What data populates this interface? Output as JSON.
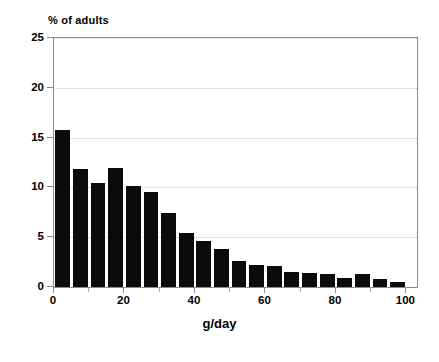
{
  "chart_data": {
    "type": "bar",
    "title": "",
    "subtitle": "",
    "xlabel": "g/day",
    "ylabel": "% of adults",
    "xlim": [
      0,
      103
    ],
    "ylim": [
      0,
      25
    ],
    "grid": true,
    "legend": null,
    "bar_width_units": 4.2,
    "x_tick_labels": [
      "0",
      "20",
      "40",
      "60",
      "80",
      "100"
    ],
    "x_tick_values": [
      0,
      20,
      40,
      60,
      80,
      100
    ],
    "x_minor_tick_values": [
      10,
      30,
      50,
      70,
      90
    ],
    "y_tick_labels": [
      "0",
      "5",
      "10",
      "15",
      "20",
      "25"
    ],
    "y_tick_values": [
      0,
      5,
      10,
      15,
      20,
      25
    ],
    "gridline_values": [
      5,
      10,
      15,
      20,
      25
    ],
    "x": [
      2.5,
      7.5,
      12.5,
      17.5,
      22.5,
      27.5,
      32.5,
      37.5,
      42.5,
      47.5,
      52.5,
      57.5,
      62.5,
      67.5,
      72.5,
      77.5,
      82.5,
      87.5,
      92.5,
      97.5
    ],
    "categories": [
      "0-5",
      "5-10",
      "10-15",
      "15-20",
      "20-25",
      "25-30",
      "30-35",
      "35-40",
      "40-45",
      "45-50",
      "50-55",
      "55-60",
      "60-65",
      "65-70",
      "70-75",
      "75-80",
      "80-85",
      "85-90",
      "90-95",
      "95-100"
    ],
    "values": [
      15.8,
      11.8,
      10.4,
      11.9,
      10.1,
      9.5,
      7.4,
      5.4,
      4.6,
      3.8,
      2.6,
      2.2,
      2.1,
      1.5,
      1.4,
      1.3,
      0.9,
      1.3,
      0.85,
      0.5
    ],
    "bar_color": "#0b0b0b",
    "axis_color": "#8a8a8a",
    "grid_color": "#c9c9c9",
    "background_color": "#ffffff"
  }
}
